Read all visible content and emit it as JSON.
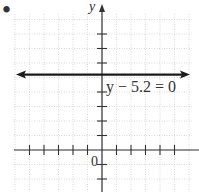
{
  "chart_data": {
    "type": "line",
    "title": "",
    "xlabel": "",
    "ylabel": "y",
    "origin_label": "0",
    "xlim": [
      -6,
      6
    ],
    "ylim": [
      -3,
      9
    ],
    "grid": true,
    "tick_step": 1,
    "x_ticks": [
      -5,
      -4,
      -3,
      -2,
      -1,
      1,
      2,
      3,
      4,
      5
    ],
    "y_ticks": [
      -2,
      -1,
      1,
      2,
      3,
      4,
      6,
      7,
      8
    ],
    "series": [
      {
        "name": "y - 5.2 = 0",
        "equation": "y − 5.2 = 0",
        "kind": "horizontal_line",
        "y": 5.2,
        "x": [
          -6,
          6
        ],
        "values": [
          5.2,
          5.2
        ],
        "arrows": "both",
        "color": "#1a1a1a"
      }
    ],
    "annotations": [
      {
        "text": "y − 5.2 = 0",
        "x": 0.1,
        "y": 4.3
      }
    ],
    "bullet_marker": "•"
  },
  "labels": {
    "y_axis": "y",
    "origin": "0",
    "equation": "y − 5.2 = 0",
    "bullet": "•"
  }
}
